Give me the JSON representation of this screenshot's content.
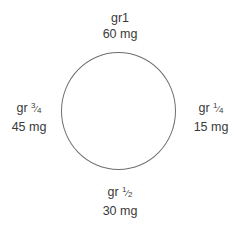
{
  "diagram": {
    "type": "dose-clock",
    "labels": [
      {
        "position": "top",
        "grain": "gr1",
        "grain_prefix": "gr1",
        "fraction": null,
        "mg": "60 mg"
      },
      {
        "position": "right",
        "grain_prefix": "gr",
        "fraction_num": "1",
        "fraction_den": "4",
        "mg": "15 mg"
      },
      {
        "position": "bottom",
        "grain_prefix": "gr",
        "fraction_num": "1",
        "fraction_den": "2",
        "mg": "30 mg"
      },
      {
        "position": "left",
        "grain_prefix": "gr",
        "fraction_num": "3",
        "fraction_den": "4",
        "mg": "45 mg"
      }
    ],
    "circle_color": "#6e6e6e",
    "text_color": "#3a3a3a"
  }
}
